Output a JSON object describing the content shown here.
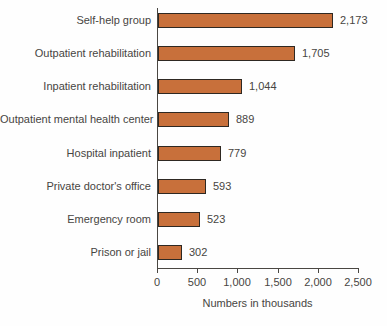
{
  "chart_data": {
    "type": "bar",
    "orientation": "horizontal",
    "title": "",
    "categories": [
      "Self-help group",
      "Outpatient rehabilitation",
      "Inpatient rehabilitation",
      "Outpatient mental health center",
      "Hospital inpatient",
      "Private doctor's office",
      "Emergency room",
      "Prison or jail"
    ],
    "values": [
      2173,
      1705,
      1044,
      889,
      779,
      593,
      523,
      302
    ],
    "value_labels": [
      "2,173",
      "1,705",
      "1,044",
      "889",
      "779",
      "593",
      "523",
      "302"
    ],
    "xlabel": "Numbers in thousands",
    "xlim": [
      0,
      2500
    ],
    "xticks": [
      0,
      500,
      1000,
      1500,
      2000,
      2500
    ],
    "xtick_labels": [
      "0",
      "500",
      "1,000",
      "1,500",
      "2,000",
      "2,500"
    ],
    "grid": false,
    "legend": false,
    "colors": {
      "bar_fill": "#c8703b",
      "bar_border": "#2e2822",
      "axis": "#4a4742",
      "text": "#474542"
    }
  }
}
